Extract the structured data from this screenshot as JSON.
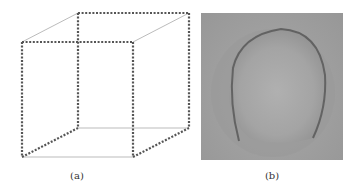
{
  "figure": {
    "panels": [
      {
        "id": "a",
        "caption": "(a)",
        "content": "wireframe cube with dotted and solid edges (Necker cube)"
      },
      {
        "id": "b",
        "caption": "(b)",
        "content": "grayscale photo of a tennis ball showing seam"
      }
    ],
    "colors": {
      "dotted_edge": "#555555",
      "solid_edge": "#999999",
      "photo_bg": "#a0a0a0"
    }
  }
}
